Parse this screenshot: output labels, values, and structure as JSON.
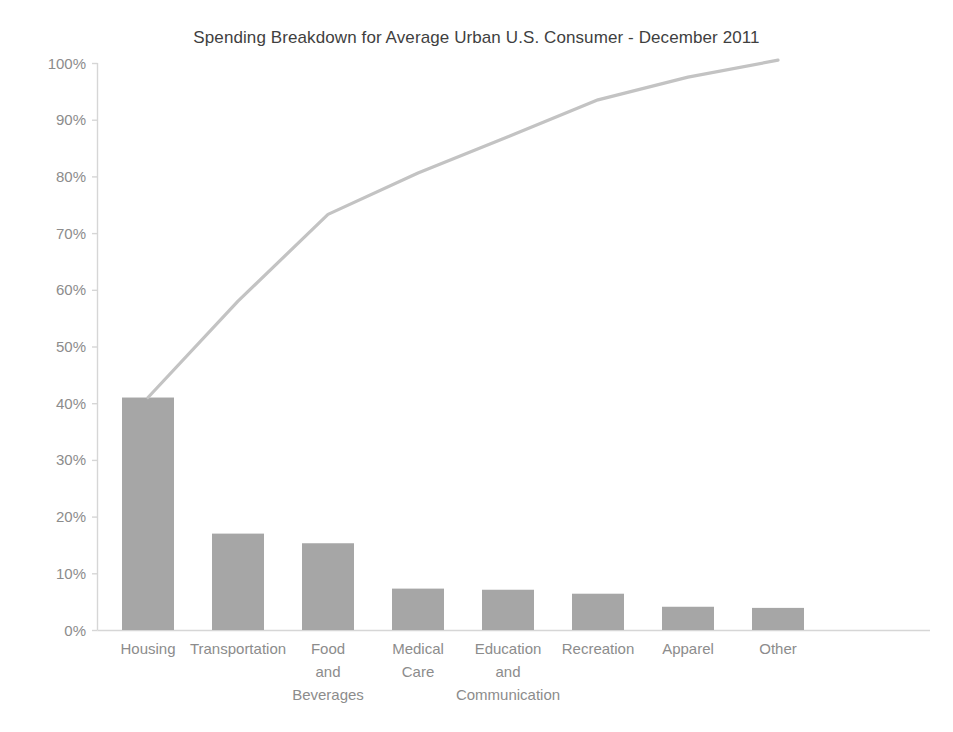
{
  "chart_data": {
    "type": "bar",
    "title": "Spending Breakdown for Average Urban U.S. Consumer - December 2011",
    "xlabel": "",
    "ylabel": "",
    "ylim": [
      0,
      100
    ],
    "grid": false,
    "legend": "none",
    "categories": [
      "Housing",
      "Transportation",
      "Food and Beverages",
      "Medical Care",
      "Education and Communication",
      "Recreation",
      "Apparel",
      "Other"
    ],
    "category_label_lines": [
      [
        "Housing"
      ],
      [
        "Transportation"
      ],
      [
        "Food",
        "and",
        "Beverages"
      ],
      [
        "Medical",
        "Care"
      ],
      [
        "Education",
        "and",
        "Communication"
      ],
      [
        "Recreation"
      ],
      [
        "Apparel"
      ],
      [
        "Other"
      ]
    ],
    "values": [
      41.0,
      17.0,
      15.3,
      7.3,
      7.1,
      6.4,
      4.1,
      3.9
    ],
    "series": [
      {
        "name": "Share of spending",
        "type": "bar",
        "values": [
          41.0,
          17.0,
          15.3,
          7.3,
          7.1,
          6.4,
          4.1,
          3.9
        ]
      },
      {
        "name": "Cumulative share",
        "type": "line",
        "values": [
          41.0,
          58.0,
          73.3,
          80.6,
          87.0,
          93.5,
          97.5,
          100.5
        ]
      }
    ],
    "y_ticks": [
      0,
      10,
      20,
      30,
      40,
      50,
      60,
      70,
      80,
      90,
      100
    ],
    "y_tick_labels": [
      "0%",
      "10%",
      "20%",
      "30%",
      "40%",
      "50%",
      "60%",
      "70%",
      "80%",
      "90%",
      "100%"
    ],
    "colors": {
      "bar": "#a6a6a6",
      "line": "#c3c3c3",
      "axis": "#d6d6d6",
      "tick_text": "#8c8c8c",
      "title_text": "#3f3f3f",
      "background": "#ffffff"
    }
  }
}
